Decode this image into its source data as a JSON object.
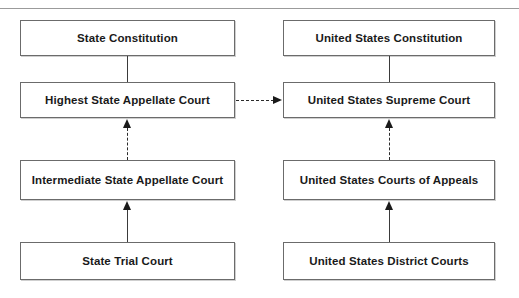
{
  "diagram": {
    "columns": {
      "state": {
        "name": "State court system",
        "nodes": [
          {
            "id": "state-constitution",
            "label": "State Constitution"
          },
          {
            "id": "highest-state-appellate-court",
            "label": "Highest State Appellate Court"
          },
          {
            "id": "intermediate-state-appellate-court",
            "label": "Intermediate State Appellate Court"
          },
          {
            "id": "state-trial-court",
            "label": "State Trial Court"
          }
        ]
      },
      "federal": {
        "name": "Federal court system",
        "nodes": [
          {
            "id": "united-states-constitution",
            "label": "United States Constitution"
          },
          {
            "id": "united-states-supreme-court",
            "label": "United States Supreme Court"
          },
          {
            "id": "united-states-courts-of-appeals",
            "label": "United States Courts of Appeals"
          },
          {
            "id": "united-states-district-courts",
            "label": "United States District Courts"
          }
        ]
      }
    },
    "connectors": [
      {
        "id": "state-constitution-to-highest-state-appellate-court",
        "style": "solid",
        "arrow": "none",
        "direction": "vertical"
      },
      {
        "id": "intermediate-state-appellate-court-to-highest-state-appellate-court",
        "style": "dashed",
        "arrow": "up",
        "direction": "vertical"
      },
      {
        "id": "state-trial-court-to-intermediate-state-appellate-court",
        "style": "solid",
        "arrow": "up",
        "direction": "vertical"
      },
      {
        "id": "united-states-constitution-to-united-states-supreme-court",
        "style": "solid",
        "arrow": "none",
        "direction": "vertical"
      },
      {
        "id": "united-states-courts-of-appeals-to-united-states-supreme-court",
        "style": "dashed",
        "arrow": "up",
        "direction": "vertical"
      },
      {
        "id": "united-states-district-courts-to-united-states-courts-of-appeals",
        "style": "solid",
        "arrow": "up",
        "direction": "vertical"
      },
      {
        "id": "highest-state-appellate-court-to-united-states-supreme-court",
        "style": "dashed",
        "arrow": "right",
        "direction": "horizontal"
      }
    ],
    "colors": {
      "box_border": "#6b6b6b",
      "box_fill": "#ffffff",
      "text": "#1a1a1a",
      "connector": "#2b2b2b",
      "rule": "#9b9b9b"
    }
  }
}
